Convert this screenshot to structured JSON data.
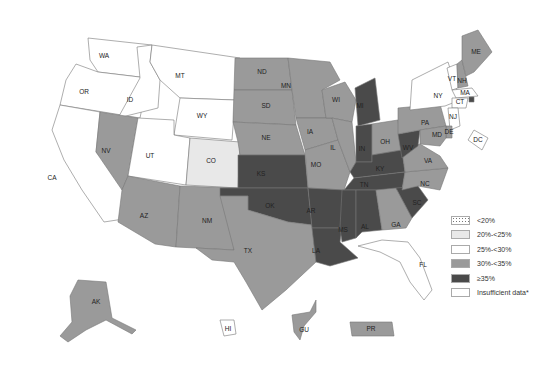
{
  "map": {
    "title": "",
    "categories": [
      {
        "key": "lt20",
        "label": "<20%",
        "color": "#ffffff",
        "pattern": "dotted"
      },
      {
        "key": "c20_25",
        "label": "20%-<25%",
        "color": "#e8e8e8"
      },
      {
        "key": "c25_30",
        "label": "25%-<30%",
        "color": "#ffffff"
      },
      {
        "key": "c30_35",
        "label": "30%-<35%",
        "color": "#9a9a9a"
      },
      {
        "key": "ge35",
        "label": "≥35%",
        "color": "#4a4a4a"
      },
      {
        "key": "insufficient",
        "label": "Insufficient data*",
        "color": "#ffffff"
      }
    ],
    "states": [
      {
        "abbr": "WA",
        "category": "c25_30"
      },
      {
        "abbr": "OR",
        "category": "c25_30"
      },
      {
        "abbr": "CA",
        "category": "c25_30"
      },
      {
        "abbr": "ID",
        "category": "c25_30"
      },
      {
        "abbr": "NV",
        "category": "c30_35"
      },
      {
        "abbr": "MT",
        "category": "c25_30"
      },
      {
        "abbr": "WY",
        "category": "c25_30"
      },
      {
        "abbr": "UT",
        "category": "c25_30"
      },
      {
        "abbr": "CO",
        "category": "c20_25"
      },
      {
        "abbr": "AZ",
        "category": "c30_35"
      },
      {
        "abbr": "NM",
        "category": "c30_35"
      },
      {
        "abbr": "ND",
        "category": "c30_35"
      },
      {
        "abbr": "SD",
        "category": "c30_35"
      },
      {
        "abbr": "NE",
        "category": "c30_35"
      },
      {
        "abbr": "KS",
        "category": "ge35"
      },
      {
        "abbr": "OK",
        "category": "ge35"
      },
      {
        "abbr": "TX",
        "category": "c30_35"
      },
      {
        "abbr": "MN",
        "category": "c30_35"
      },
      {
        "abbr": "IA",
        "category": "c30_35"
      },
      {
        "abbr": "MO",
        "category": "c30_35"
      },
      {
        "abbr": "AR",
        "category": "ge35"
      },
      {
        "abbr": "LA",
        "category": "ge35"
      },
      {
        "abbr": "WI",
        "category": "c30_35"
      },
      {
        "abbr": "IL",
        "category": "c30_35"
      },
      {
        "abbr": "MI",
        "category": "ge35"
      },
      {
        "abbr": "IN",
        "category": "ge35"
      },
      {
        "abbr": "OH",
        "category": "c30_35"
      },
      {
        "abbr": "KY",
        "category": "ge35"
      },
      {
        "abbr": "TN",
        "category": "ge35"
      },
      {
        "abbr": "MS",
        "category": "ge35"
      },
      {
        "abbr": "AL",
        "category": "ge35"
      },
      {
        "abbr": "GA",
        "category": "c30_35"
      },
      {
        "abbr": "FL",
        "category": "c25_30"
      },
      {
        "abbr": "SC",
        "category": "ge35"
      },
      {
        "abbr": "NC",
        "category": "c30_35"
      },
      {
        "abbr": "VA",
        "category": "c30_35"
      },
      {
        "abbr": "WV",
        "category": "ge35"
      },
      {
        "abbr": "PA",
        "category": "c30_35"
      },
      {
        "abbr": "NY",
        "category": "c25_30"
      },
      {
        "abbr": "VT",
        "category": "c25_30"
      },
      {
        "abbr": "NH",
        "category": "c30_35"
      },
      {
        "abbr": "ME",
        "category": "c30_35"
      },
      {
        "abbr": "MA",
        "category": "c25_30"
      },
      {
        "abbr": "RI",
        "category": "ge35"
      },
      {
        "abbr": "CT",
        "category": "c25_30"
      },
      {
        "abbr": "NJ",
        "category": "c25_30"
      },
      {
        "abbr": "DE",
        "category": "c30_35"
      },
      {
        "abbr": "MD",
        "category": "c30_35"
      },
      {
        "abbr": "DC",
        "category": "c25_30"
      },
      {
        "abbr": "AK",
        "category": "c30_35"
      },
      {
        "abbr": "HI",
        "category": "c25_30"
      },
      {
        "abbr": "GU",
        "category": "c30_35"
      },
      {
        "abbr": "PR",
        "category": "c30_35"
      }
    ]
  }
}
